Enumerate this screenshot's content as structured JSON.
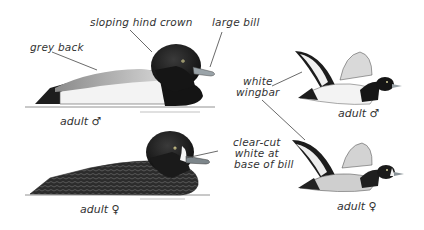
{
  "figure": {
    "birds": [
      {
        "id": "male-swimming",
        "caption": "adult ♂"
      },
      {
        "id": "male-flying",
        "caption": "adult ♂"
      },
      {
        "id": "female-swimming",
        "caption": "adult ♀"
      },
      {
        "id": "female-flying",
        "caption": "adult ♀"
      }
    ],
    "annotations": {
      "sloping_hind_crown": "sloping hind crown",
      "large_bill": "large bill",
      "grey_back": "grey back",
      "white_wingbar_line1": "white",
      "white_wingbar_line2": "wingbar",
      "clear_cut_line1": "clear-cut",
      "clear_cut_line2": "white at",
      "clear_cut_line3": "base of bill"
    },
    "colors": {
      "head": "#161616",
      "back_grey": "#bdbdbd",
      "flank_white": "#f4f4f4",
      "bill": "#9aa3a8",
      "female_body": "#2e2e2e",
      "line": "#444444"
    }
  }
}
